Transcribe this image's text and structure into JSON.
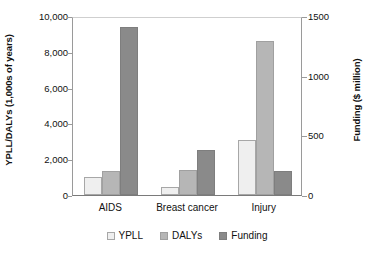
{
  "chart_data": {
    "type": "bar",
    "title": "",
    "subtitle": "",
    "categories": [
      "AIDS",
      "Breast cancer",
      "Injury"
    ],
    "series": [
      {
        "name": "YPLL",
        "axis": "left",
        "values": [
          1000,
          450,
          3100
        ],
        "color": "#efefef"
      },
      {
        "name": "DALYs",
        "axis": "left",
        "values": [
          1350,
          1400,
          8600
        ],
        "color": "#b6b6b6"
      },
      {
        "name": "Funding",
        "axis": "right",
        "values": [
          1410,
          375,
          200
        ],
        "color": "#8a8a8a"
      }
    ],
    "funding_on_left_scale": [
      9400,
      2500,
      1350
    ],
    "xlabel": "",
    "ylabel": "YPLL/DALYs (1,000s of years)",
    "ylabel_right": "Funding ($ million)",
    "ylim": [
      0,
      10000
    ],
    "ylim_right": [
      0,
      1500
    ],
    "yticks": [
      "0",
      "2,000",
      "4,000",
      "6,000",
      "8,000",
      "10,000"
    ],
    "ytick_values": [
      0,
      2000,
      4000,
      6000,
      8000,
      10000
    ],
    "yticks_right": [
      "0",
      "500",
      "1000",
      "1500"
    ],
    "ytick_values_right": [
      0,
      500,
      1000,
      1500
    ],
    "grid": false,
    "legend_position": "bottom",
    "legend": [
      "YPLL",
      "DALYs",
      "Funding"
    ]
  }
}
